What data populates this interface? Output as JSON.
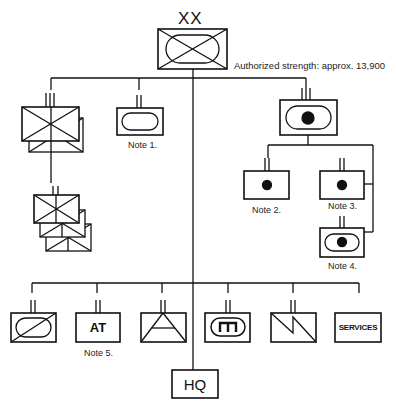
{
  "title": {
    "echelon": "XX",
    "strength": "Authorized strength: approx. 13,900"
  },
  "units": {
    "division": {
      "symbol": "armored-cavalry-x"
    },
    "brigades": {
      "symbol": "infantry-x-stacked"
    },
    "battalions": {
      "symbol": "infantry-x-stacked-3"
    },
    "recon": {
      "symbol": "armored-oval",
      "note": "Note 1."
    },
    "artillery_regiment": {
      "symbol": "self-propelled-artillery"
    },
    "artillery_battalion_a": {
      "symbol": "artillery-dot",
      "note": "Note 2."
    },
    "artillery_battalion_b": {
      "symbol": "artillery-dot",
      "note": "Note 3."
    },
    "artillery_battalion_c": {
      "symbol": "self-propelled-artillery",
      "note": "Note 4."
    },
    "support": [
      {
        "symbol": "armored-cavalry-slash"
      },
      {
        "symbol": "anti-tank",
        "text": "AT",
        "note": "Note 5."
      },
      {
        "symbol": "engineer-triangle"
      },
      {
        "symbol": "maintenance"
      },
      {
        "symbol": "signal-zigzag"
      },
      {
        "symbol": "services",
        "text": "SERVICES"
      }
    ],
    "hq": {
      "text": "HQ"
    }
  },
  "colors": {
    "line": "#111111",
    "background": "#ffffff"
  }
}
